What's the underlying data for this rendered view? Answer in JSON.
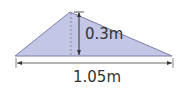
{
  "diagram": {
    "shape": "triangle",
    "fill_color": "#c4c6e6",
    "stroke_color": "#6a6c9c",
    "dimensions": {
      "height_label": "0.3m",
      "base_label": "1.05m"
    }
  }
}
